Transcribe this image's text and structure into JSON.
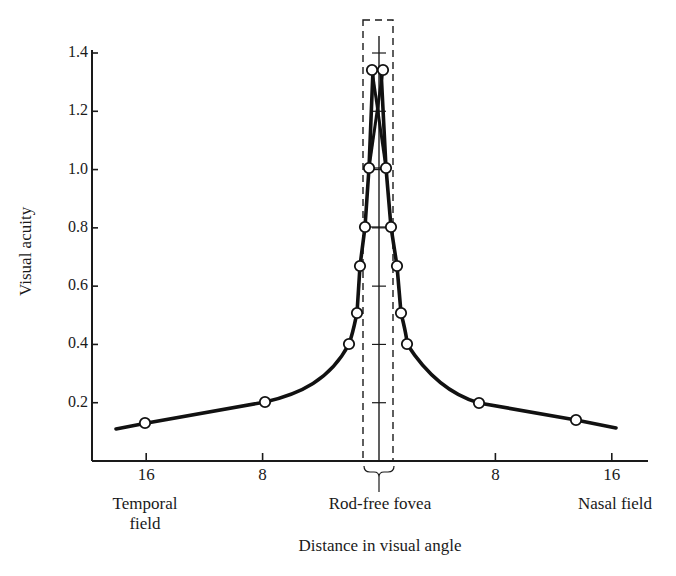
{
  "chart_data": {
    "type": "line",
    "title": "",
    "xlabel": "Distance in visual angle",
    "ylabel": "Visual acuity",
    "ylim": [
      0,
      1.4
    ],
    "yticks": [
      "0.2",
      "0.4",
      "0.6",
      "0.8",
      "1.0",
      "1.2",
      "1.4"
    ],
    "xticks": [
      "16",
      "8",
      "8",
      "16"
    ],
    "x_region_labels": {
      "left": [
        "Temporal",
        "field"
      ],
      "center": "Rod-free fovea",
      "right": "Nasal field"
    },
    "x_units": "degrees (negative = temporal, positive = nasal)",
    "grid": false,
    "legend": null,
    "series": [
      {
        "name": "Visual acuity",
        "points": [
          {
            "x": -16,
            "y": 0.13
          },
          {
            "x": -8,
            "y": 0.2
          },
          {
            "x": -2.1,
            "y": 0.4
          },
          {
            "x": -1.6,
            "y": 0.5
          },
          {
            "x": -1.3,
            "y": 0.67
          },
          {
            "x": -1.0,
            "y": 0.8
          },
          {
            "x": -0.6,
            "y": 1.0
          },
          {
            "x": -0.3,
            "y": 1.33
          },
          {
            "x": 0.3,
            "y": 1.33
          },
          {
            "x": 0.6,
            "y": 1.0
          },
          {
            "x": 0.9,
            "y": 0.8
          },
          {
            "x": 1.3,
            "y": 0.67
          },
          {
            "x": 1.5,
            "y": 0.5
          },
          {
            "x": 1.9,
            "y": 0.4
          },
          {
            "x": 7,
            "y": 0.19
          },
          {
            "x": 15,
            "y": 0.14
          }
        ]
      }
    ],
    "annotations": [
      "Dashed rectangle marks rod-free fovea region around 0°",
      "Central vertical line with tick marks at 0.2 intervals"
    ]
  }
}
